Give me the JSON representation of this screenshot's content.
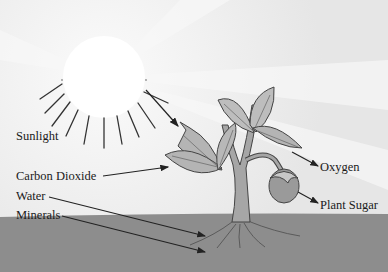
{
  "diagram": {
    "type": "photosynthesis illustration",
    "labels": {
      "sunlight": "Sunlight",
      "carbon_dioxide": "Carbon Dioxide",
      "water": "Water",
      "minerals": "Minerals",
      "oxygen": "Oxygen",
      "plant_sugar": "Plant Sugar"
    },
    "inputs": [
      "Sunlight",
      "Carbon Dioxide",
      "Water",
      "Minerals"
    ],
    "outputs": [
      "Oxygen",
      "Plant Sugar"
    ],
    "colors": {
      "sky": "#eeeeee",
      "ground": "#8c8c8c",
      "sun": "#ffffff",
      "leaf": "#b4b4b4",
      "line": "#333333"
    }
  }
}
